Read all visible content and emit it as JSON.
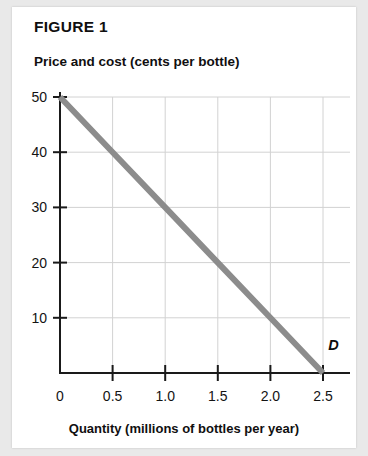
{
  "figure": {
    "title": "FIGURE 1"
  },
  "chart_data": {
    "type": "line",
    "title": "FIGURE 1",
    "ylabel": "Price and cost (cents per bottle)",
    "xlabel": "Quantity (millions of bottles per year)",
    "xlim": [
      0,
      2.85
    ],
    "ylim": [
      0,
      56
    ],
    "grid": true,
    "legend": "none",
    "x_ticks": [
      {
        "value": 0,
        "label": "0"
      },
      {
        "value": 0.5,
        "label": "0.5"
      },
      {
        "value": 1.0,
        "label": "1.0"
      },
      {
        "value": 1.5,
        "label": "1.5"
      },
      {
        "value": 2.0,
        "label": "2.0"
      },
      {
        "value": 2.5,
        "label": "2.5"
      }
    ],
    "y_ticks": [
      {
        "value": 10,
        "label": "10"
      },
      {
        "value": 20,
        "label": "20"
      },
      {
        "value": 30,
        "label": "30"
      },
      {
        "value": 40,
        "label": "40"
      },
      {
        "value": 50,
        "label": "50"
      }
    ],
    "series": [
      {
        "name": "D",
        "annotation": "D",
        "color": "#8c8c8c",
        "x": [
          0,
          0.5,
          1.0,
          1.5,
          2.0,
          2.5
        ],
        "values": [
          50,
          40,
          30,
          20,
          10,
          0
        ]
      }
    ],
    "annotations": [
      {
        "text": "D",
        "x": 2.55,
        "y": 4.2
      }
    ]
  },
  "colors": {
    "curve": "#8c8c8c",
    "grid": "#d2d2d2",
    "axis": "#1a1a1a",
    "card": "#ffffff",
    "page": "#e9e9e9"
  }
}
